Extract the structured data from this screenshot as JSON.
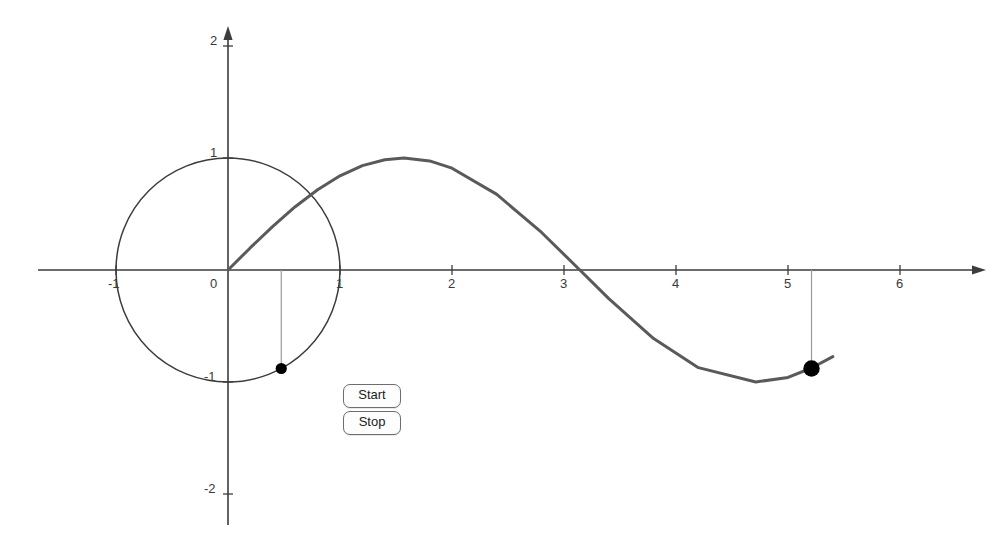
{
  "chart_data": {
    "type": "line",
    "title": "",
    "xlabel": "",
    "ylabel": "",
    "xlim": [
      -1.7,
      6.95
    ],
    "ylim": [
      -2.25,
      2.1
    ],
    "grid": false,
    "legend_position": "none",
    "series": [
      {
        "name": "sin(x)",
        "comment": "sine curve drawn from x=0 rightward",
        "x": [
          0,
          0.2,
          0.4,
          0.6,
          0.8,
          1.0,
          1.2,
          1.4,
          1.5708,
          1.8,
          2.0,
          2.4,
          2.8,
          3.1416,
          3.4,
          3.8,
          4.2,
          4.7124,
          5.0,
          5.21,
          5.4
        ],
        "values": [
          0,
          0.199,
          0.389,
          0.565,
          0.717,
          0.841,
          0.932,
          0.985,
          1.0,
          0.974,
          0.909,
          0.675,
          0.335,
          0.0,
          -0.256,
          -0.612,
          -0.872,
          -1.0,
          -0.959,
          -0.875,
          -0.773
        ]
      },
      {
        "name": "unit-circle",
        "comment": "unit circle centered at origin, radius 1",
        "center": [
          0,
          0
        ],
        "radius": 1
      }
    ],
    "points": [
      {
        "name": "circle-point",
        "x": 0.4756,
        "y": -0.8796,
        "label": ""
      },
      {
        "name": "sine-point",
        "x": 5.21,
        "y": -0.8796,
        "label": ""
      }
    ],
    "xticks": [
      -1,
      0,
      1,
      2,
      3,
      4,
      5,
      6
    ],
    "xtick_labels": [
      "-1",
      "0",
      "1",
      "2",
      "3",
      "4",
      "5",
      "6"
    ],
    "yticks": [
      -2,
      -1,
      1,
      2
    ],
    "ytick_labels": [
      "-2",
      "-1",
      "1",
      "2"
    ],
    "colors": {
      "curve": "#5a5a5a",
      "circle": "#3c3c3c",
      "axis": "#3c3c3c",
      "point": "#000000",
      "connector": "#9a9a9a",
      "background": "#ffffff"
    }
  },
  "controls": {
    "start_label": "Start",
    "stop_label": "Stop"
  },
  "axis_labels": {
    "x": {
      "neg1": "-1",
      "origin": "0",
      "one": "1",
      "two": "2",
      "three": "3",
      "four": "4",
      "five": "5",
      "six": "6"
    },
    "y": {
      "two": "2",
      "one": "1",
      "neg1": "-1",
      "neg2": "-2"
    }
  }
}
